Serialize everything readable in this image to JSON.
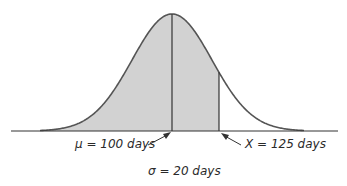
{
  "diagram": {
    "type": "normal-distribution",
    "mean_label": "μ = 100 days",
    "x_label": "X = 125 days",
    "sigma_label": "σ = 20 days",
    "mean": 100,
    "x_value": 125,
    "sigma": 20,
    "unit": "days",
    "shaded_region": "from left tail to X",
    "colors": {
      "curve": "#555555",
      "fill": "#d2d2d2",
      "axis": "#333333",
      "text": "#2a2a2a"
    }
  }
}
